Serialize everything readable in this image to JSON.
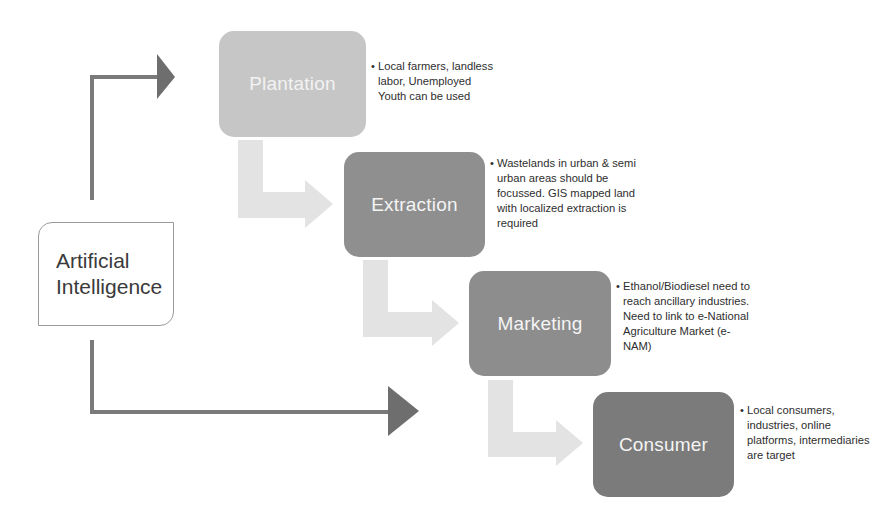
{
  "diagram": {
    "type": "process-flow",
    "source_node": {
      "label_line1": "Artificial",
      "label_line2": "Intelligence"
    },
    "stages": [
      {
        "id": "plantation",
        "label": "Plantation",
        "color": "#c6c6c6",
        "note": "Local farmers, landless labor, Unemployed Youth can be used"
      },
      {
        "id": "extraction",
        "label": "Extraction",
        "color": "#8f8f8f",
        "note": "Wastelands in urban & semi urban areas should be focussed. GIS mapped land with localized extraction is required"
      },
      {
        "id": "marketing",
        "label": "Marketing",
        "color": "#8d8d8d",
        "note": "Ethanol/Biodiesel need to reach ancillary industries. Need to link to e-National Agriculture Market (e-NAM)"
      },
      {
        "id": "consumer",
        "label": "Consumer",
        "color": "#7b7b7b",
        "note": "Local consumers, industries, online platforms, intermediaries are target"
      }
    ],
    "bullet": "•",
    "colors": {
      "connector_arrow": "#7a7a7a",
      "step_arrow": "#e3e3e3",
      "ai_border": "#9a9a9a"
    },
    "edges": [
      {
        "from": "Artificial Intelligence",
        "to": "Plantation",
        "style": "dark-elbow-arrow"
      },
      {
        "from": "Artificial Intelligence",
        "to": "Consumer",
        "style": "dark-elbow-arrow"
      },
      {
        "from": "Plantation",
        "to": "Extraction",
        "style": "light-bent-arrow"
      },
      {
        "from": "Extraction",
        "to": "Marketing",
        "style": "light-bent-arrow"
      },
      {
        "from": "Marketing",
        "to": "Consumer",
        "style": "light-bent-arrow"
      }
    ]
  }
}
